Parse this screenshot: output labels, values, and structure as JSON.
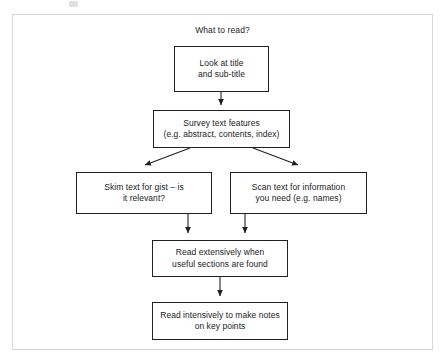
{
  "diagram": {
    "title": "What to read?",
    "type": "flowchart",
    "orientation": "top-to-bottom",
    "nodes": [
      {
        "id": "look-at-title",
        "text": "Look at title\nand sub-title",
        "shape": "rectangle",
        "x": 174,
        "y": 46,
        "w": 95,
        "h": 46
      },
      {
        "id": "survey-text-features",
        "text": "Survey text features\n(e.g. abstract, contents, index)",
        "shape": "rectangle",
        "x": 153,
        "y": 110,
        "w": 137,
        "h": 38
      },
      {
        "id": "skim-text",
        "text": "Skim text for gist – is\nit relevant?",
        "shape": "rectangle",
        "x": 76,
        "y": 172,
        "w": 136,
        "h": 42
      },
      {
        "id": "scan-text",
        "text": "Scan text for information\nyou need (e.g. names)",
        "shape": "rectangle",
        "x": 230,
        "y": 172,
        "w": 137,
        "h": 42
      },
      {
        "id": "read-extensively",
        "text": "Read extensively when\nuseful sections are found",
        "shape": "rectangle",
        "x": 152,
        "y": 240,
        "w": 136,
        "h": 37
      },
      {
        "id": "read-intensively",
        "text": "Read intensively to make notes\non key points",
        "shape": "rectangle",
        "x": 152,
        "y": 302,
        "w": 136,
        "h": 38
      }
    ],
    "edges": [
      {
        "id": "edge-title-to-survey",
        "from": "look-at-title",
        "to": "survey-text-features",
        "style": "straight-arrow"
      },
      {
        "id": "edge-survey-to-skim",
        "from": "survey-text-features",
        "to": "skim-text",
        "style": "diagonal-arrow"
      },
      {
        "id": "edge-survey-to-scan",
        "from": "survey-text-features",
        "to": "scan-text",
        "style": "diagonal-arrow"
      },
      {
        "id": "edge-skim-to-extensive",
        "from": "skim-text",
        "to": "read-extensively",
        "style": "elbow-arrow"
      },
      {
        "id": "edge-scan-to-extensive",
        "from": "scan-text",
        "to": "read-extensively",
        "style": "elbow-arrow"
      },
      {
        "id": "edge-extensive-to-intensive",
        "from": "read-extensively",
        "to": "read-intensively",
        "style": "straight-arrow"
      }
    ],
    "colors": {
      "node_border": "#231f20",
      "node_fill": "#ffffff",
      "edge": "#231f20",
      "text": "#1b1b1b",
      "frame": "#d8d8d8",
      "background": "#ffffff"
    }
  }
}
